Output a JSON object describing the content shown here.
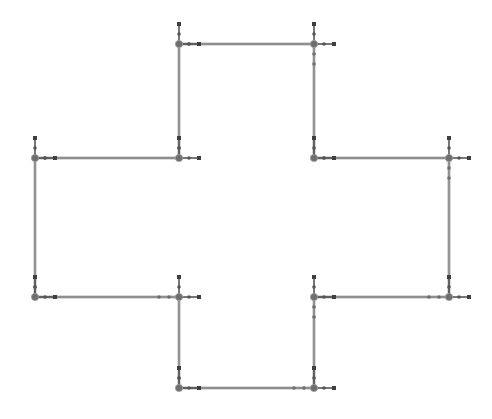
{
  "diagram": {
    "type": "polygon-outline",
    "shape": "plus-cross",
    "width": 492,
    "height": 419,
    "colors": {
      "background": "#ffffff",
      "edge": "#7a7a7a",
      "edge_halo": "#cfcfcf",
      "node": "#6e6e6e",
      "handle": "#555555",
      "handle_cap": "#3f3f3f"
    },
    "vertices": [
      {
        "id": "v1",
        "x": 179,
        "y": 44
      },
      {
        "id": "v2",
        "x": 314,
        "y": 44
      },
      {
        "id": "v3",
        "x": 314,
        "y": 158
      },
      {
        "id": "v4",
        "x": 449,
        "y": 158
      },
      {
        "id": "v5",
        "x": 449,
        "y": 297
      },
      {
        "id": "v6",
        "x": 314,
        "y": 297
      },
      {
        "id": "v7",
        "x": 314,
        "y": 388
      },
      {
        "id": "v8",
        "x": 179,
        "y": 388
      },
      {
        "id": "v9",
        "x": 179,
        "y": 297
      },
      {
        "id": "v10",
        "x": 35,
        "y": 297
      },
      {
        "id": "v11",
        "x": 35,
        "y": 158
      },
      {
        "id": "v12",
        "x": 179,
        "y": 158
      }
    ],
    "handle": {
      "up_length": 20,
      "right_length": 20,
      "mid_dot_offset": 10
    }
  }
}
